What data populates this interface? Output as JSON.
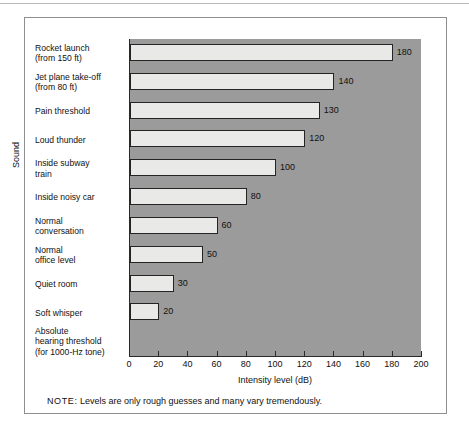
{
  "chart_data": {
    "type": "bar",
    "orientation": "horizontal",
    "title": "",
    "xlabel": "Intensity level (dB)",
    "ylabel": "Sound",
    "xlim": [
      0,
      200
    ],
    "xticks": [
      0,
      20,
      40,
      60,
      80,
      100,
      120,
      140,
      160,
      180,
      200
    ],
    "grid": false,
    "legend": false,
    "categories": [
      "Rocket launch (from 150 ft)",
      "Jet plane take-off (from 80 ft)",
      "Pain threshold",
      "Loud thunder",
      "Inside subway train",
      "Inside noisy car",
      "Normal conversation",
      "Normal office level",
      "Quiet room",
      "Soft whisper",
      "Absolute hearing threshold (for 1000-Hz tone)"
    ],
    "values": [
      180,
      140,
      130,
      120,
      100,
      80,
      60,
      50,
      30,
      20,
      0
    ],
    "value_labels": [
      "180",
      "140",
      "130",
      "120",
      "100",
      "80",
      "60",
      "50",
      "30",
      "20",
      ""
    ],
    "annotation": "NOTE:  Levels are only rough guesses and many vary tremendously."
  },
  "axes": {
    "y_title": "Sound",
    "x_title": "Intensity level (dB)",
    "x_tick_labels": [
      "0",
      "20",
      "40",
      "60",
      "80",
      "100",
      "120",
      "140",
      "160",
      "180",
      "200"
    ]
  },
  "categories_lines": [
    [
      "Rocket launch",
      "(from 150 ft)"
    ],
    [
      "Jet plane take-off",
      "(from 80 ft)"
    ],
    [
      "Pain threshold"
    ],
    [
      "Loud thunder"
    ],
    [
      "Inside subway",
      "train"
    ],
    [
      "Inside noisy car"
    ],
    [
      "Normal",
      "conversation"
    ],
    [
      "Normal",
      "office level"
    ],
    [
      "Quiet room"
    ],
    [
      "Soft whisper"
    ],
    [
      "Absolute",
      "hearing threshold",
      "(for 1000-Hz tone)"
    ]
  ],
  "note": {
    "label": "NOTE:",
    "text": "Levels are only rough guesses and many vary tremendously."
  },
  "colors": {
    "plot_background": "#9b9b9b",
    "bar_fill": "#e9e9e7",
    "bar_stroke": "#242424",
    "frame": "#8e8e8e",
    "text": "#111111"
  }
}
